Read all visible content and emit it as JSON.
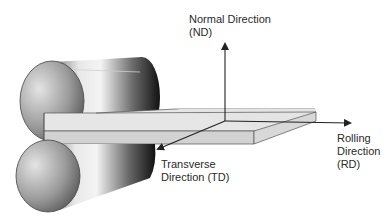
{
  "diagram": {
    "type": "rolling-mill-schematic",
    "components": [
      "upper-roll",
      "lower-roll",
      "rolled-sheet",
      "coordinate-axes"
    ],
    "axes": {
      "normal": {
        "line1": "Normal Direction",
        "line2": "(ND)"
      },
      "rolling": {
        "line1": "Rolling",
        "line2": "Direction",
        "line3": "(RD)"
      },
      "transverse": {
        "line1": "Transverse",
        "line2": "Direction (TD)"
      }
    },
    "colors": {
      "background": "#ffffff",
      "sheet_top": "#e6e6e6",
      "sheet_side": "#d2d2d2",
      "roll_dark": "#111111",
      "roll_light": "#f2f2f2",
      "axis_line": "#222222",
      "text": "#2a2a2a"
    }
  }
}
